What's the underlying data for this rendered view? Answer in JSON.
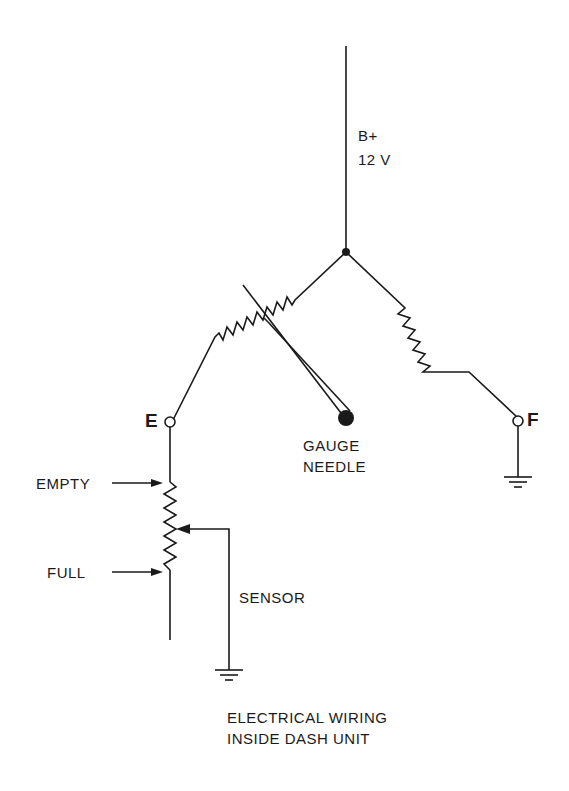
{
  "diagram": {
    "supply": {
      "line1": "B+",
      "line2": "12 V"
    },
    "terminals": {
      "e": "E",
      "f": "F"
    },
    "needle": {
      "line1": "GAUGE",
      "line2": "NEEDLE"
    },
    "sensor_labels": {
      "empty": "EMPTY",
      "full": "FULL",
      "sensor": "SENSOR"
    },
    "caption": {
      "line1": "ELECTRICAL WIRING",
      "line2": "INSIDE DASH UNIT"
    },
    "colors": {
      "ink": "#1a1a1a",
      "background": "#ffffff"
    }
  }
}
